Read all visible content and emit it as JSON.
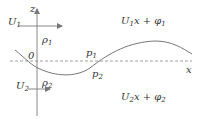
{
  "diagram": {
    "axis_labels": {
      "vertical": "z",
      "horizontal": "x",
      "origin": "0"
    },
    "upper_region": {
      "velocity": {
        "base": "U",
        "sub": "1"
      },
      "density": {
        "base": "ρ",
        "sub": "1"
      },
      "pressure": {
        "base": "p",
        "sub": "1"
      },
      "potential": {
        "base": "U",
        "sub": "1",
        "mid": "x + φ",
        "sub2": "1"
      }
    },
    "lower_region": {
      "velocity": {
        "base": "U",
        "sub": "2"
      },
      "density": {
        "base": "ρ",
        "sub": "2"
      },
      "pressure": {
        "base": "p",
        "sub": "2"
      },
      "potential": {
        "base": "U",
        "sub": "2",
        "mid": "x + φ",
        "sub2": "2"
      }
    },
    "colors": {
      "stroke": "#777777",
      "text": "#333333"
    }
  }
}
